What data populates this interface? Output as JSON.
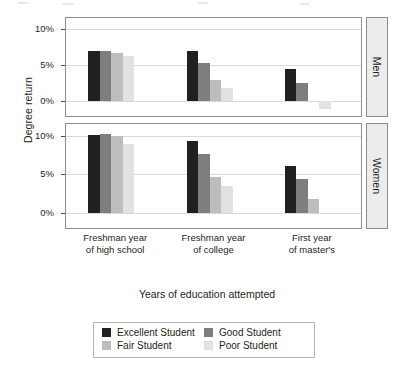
{
  "chart_data": {
    "type": "bar",
    "title": "",
    "xlabel": "Years of education attempted",
    "ylabel": "Degree return",
    "categories": [
      "Freshman year of high school",
      "Freshman year of college",
      "First year of master's"
    ],
    "category_lines": [
      [
        "Freshman year",
        "of high school"
      ],
      [
        "Freshman year",
        "of college"
      ],
      [
        "First year",
        "of master's"
      ]
    ],
    "ylim": [
      -2,
      11.5
    ],
    "yticks": [
      0,
      5,
      10
    ],
    "ytick_labels": [
      "0%",
      "5%",
      "10%"
    ],
    "grid": true,
    "legend_position": "bottom",
    "panels": [
      {
        "name": "Men",
        "series": [
          {
            "name": "Excellent Student",
            "values": [
              7.0,
              6.9,
              4.5
            ]
          },
          {
            "name": "Good Student",
            "values": [
              7.0,
              5.3,
              2.5
            ]
          },
          {
            "name": "Fair Student",
            "values": [
              6.7,
              2.9,
              0.0
            ]
          },
          {
            "name": "Poor Student",
            "values": [
              6.2,
              1.9,
              -1.1
            ]
          }
        ]
      },
      {
        "name": "Women",
        "series": [
          {
            "name": "Excellent Student",
            "values": [
              10.1,
              9.3,
              6.0
            ]
          },
          {
            "name": "Good Student",
            "values": [
              10.2,
              7.6,
              4.4
            ]
          },
          {
            "name": "Fair Student",
            "values": [
              9.9,
              4.6,
              1.7
            ]
          },
          {
            "name": "Poor Student",
            "values": [
              8.9,
              3.4,
              0.0
            ]
          }
        ]
      }
    ],
    "legend": [
      {
        "label": "Excellent Student",
        "color": "#231f20"
      },
      {
        "label": "Good Student",
        "color": "#7e7e7e"
      },
      {
        "label": "Fair Student",
        "color": "#bdbdbd"
      },
      {
        "label": "Poor Student",
        "color": "#e2e2e2"
      }
    ]
  },
  "strips": {
    "men": "Men",
    "women": "Women"
  },
  "axis": {
    "y_title": "Degree return",
    "x_title": "Years of education attempted",
    "tick_0": "0%",
    "tick_5": "5%",
    "tick_10": "10%"
  }
}
